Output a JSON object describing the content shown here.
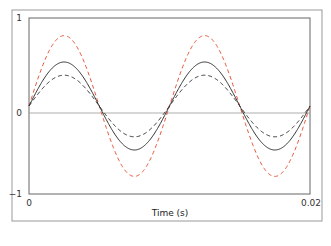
{
  "chart_data": {
    "type": "line",
    "title": "",
    "xlabel": "Time (s)",
    "ylabel": "",
    "xlim": [
      0,
      0.02
    ],
    "ylim": [
      -1,
      1
    ],
    "x_ticks": [
      "0",
      "0.02"
    ],
    "y_ticks": [
      "1",
      "0",
      "-1"
    ],
    "grid": false,
    "legend": null,
    "series": [
      {
        "name": "red-dashed",
        "style": "dashed",
        "color": "#e8553a",
        "amplitude": 0.8,
        "frequency_hz": 100
      },
      {
        "name": "black-solid",
        "style": "solid",
        "color": "#333333",
        "amplitude": 0.5,
        "frequency_hz": 100
      },
      {
        "name": "black-dashed",
        "style": "dashed",
        "color": "#333333",
        "amplitude": 0.35,
        "frequency_hz": 100
      }
    ]
  },
  "labels": {
    "xlabel": "Time (s)",
    "x0": "0",
    "x1": "0.02",
    "y1": "1",
    "y0": "0",
    "ym1": "−1"
  }
}
